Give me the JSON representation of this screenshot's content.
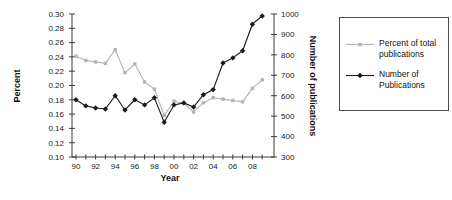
{
  "chart_data": {
    "type": "line",
    "xlabel": "Year",
    "years": [
      1990,
      1991,
      1992,
      1993,
      1994,
      1995,
      1996,
      1997,
      1998,
      1999,
      2000,
      2001,
      2002,
      2003,
      2004,
      2005,
      2006,
      2007,
      2008,
      2009
    ],
    "x_tick_labels": [
      "90",
      "92",
      "94",
      "96",
      "98",
      "00",
      "02",
      "04",
      "06",
      "08"
    ],
    "left_axis": {
      "label": "Percent",
      "min": 0.1,
      "max": 0.3,
      "step": 0.02,
      "ticks": [
        "0.30",
        "0.28",
        "0.26",
        "0.24",
        "0.22",
        "0.20",
        "0.18",
        "0.16",
        "0.14",
        "0.12",
        "0.10"
      ]
    },
    "right_axis": {
      "label": "Number of publications",
      "min": 300,
      "max": 1000,
      "step": 100,
      "ticks": [
        "1000",
        "900",
        "800",
        "700",
        "600",
        "500",
        "400",
        "300"
      ]
    },
    "series": [
      {
        "name": "Percent of total publications",
        "axis": "left",
        "color": "#b3b3b3",
        "marker": "square",
        "values": [
          0.241,
          0.235,
          0.233,
          0.231,
          0.25,
          0.218,
          0.23,
          0.205,
          0.195,
          0.158,
          0.178,
          0.175,
          0.163,
          0.176,
          0.183,
          0.181,
          0.179,
          0.177,
          0.196,
          0.208
        ]
      },
      {
        "name": "Number of Publications",
        "axis": "right",
        "color": "#1a1a1a",
        "marker": "diamond",
        "values": [
          580,
          550,
          540,
          535,
          600,
          530,
          580,
          555,
          590,
          470,
          555,
          565,
          545,
          605,
          630,
          760,
          785,
          820,
          950,
          990
        ]
      }
    ],
    "legend": {
      "position": "right",
      "entries": [
        "Percent of total publications",
        "Number of Publications"
      ]
    },
    "grid": false,
    "axis_color": "#3a3a3a"
  }
}
